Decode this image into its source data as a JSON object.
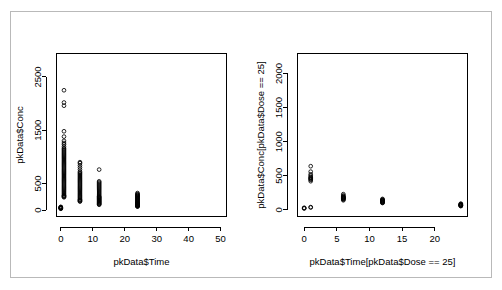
{
  "figure": {
    "background_color": "#ffffff",
    "foreground_color": "#000000",
    "frame_color": "#b9b9b9",
    "panels": 2
  },
  "chart_data": [
    {
      "type": "scatter",
      "panel": "left",
      "title": "",
      "xlabel": "pkData$Time",
      "ylabel": "pkData$Conc",
      "xlim": [
        -1.5,
        52.0
      ],
      "ylim": [
        -130,
        2950
      ],
      "xticks": [
        0,
        10,
        20,
        30,
        40,
        50
      ],
      "xtick_labels": [
        "0",
        "10",
        "20",
        "30",
        "40",
        "50"
      ],
      "yticks": [
        0,
        500,
        1500,
        2500
      ],
      "ytick_labels": [
        "0",
        "500",
        "1500",
        "2500"
      ],
      "grid": false,
      "legend": null,
      "marker": "open-circle",
      "series": [
        {
          "name": "pkData",
          "x": [
            0,
            0,
            0,
            0,
            0,
            0,
            0,
            0,
            1,
            1,
            1,
            1,
            1,
            1,
            1,
            1,
            1,
            1,
            1,
            1,
            1,
            1,
            1,
            1,
            1,
            1,
            1,
            1,
            1,
            1,
            1,
            1,
            1,
            1,
            1,
            1,
            1,
            1,
            1,
            1,
            1,
            1,
            1,
            1,
            1,
            1,
            1,
            1,
            1,
            1,
            1,
            1,
            1,
            1,
            1,
            1,
            1,
            1,
            1,
            1,
            1,
            1,
            1,
            1,
            1,
            1,
            6,
            6,
            6,
            6,
            6,
            6,
            6,
            6,
            6,
            6,
            6,
            6,
            6,
            6,
            6,
            6,
            6,
            6,
            6,
            6,
            6,
            6,
            6,
            6,
            6,
            6,
            6,
            6,
            6,
            6,
            6,
            6,
            6,
            6,
            6,
            6,
            12,
            12,
            12,
            12,
            12,
            12,
            12,
            12,
            12,
            12,
            12,
            12,
            12,
            12,
            12,
            12,
            12,
            12,
            12,
            12,
            12,
            12,
            12,
            12,
            12,
            12,
            12,
            12,
            12,
            12,
            12,
            12,
            24,
            24,
            24,
            24,
            24,
            24,
            24,
            24,
            24,
            24,
            24,
            24,
            24,
            24,
            24,
            24,
            24,
            24,
            24,
            24,
            24,
            24,
            24,
            24,
            24,
            24,
            24,
            24,
            24,
            24,
            24,
            24
          ],
          "y": [
            30,
            40,
            45,
            55,
            60,
            35,
            50,
            25,
            2250,
            2020,
            1960,
            1480,
            1380,
            1300,
            1260,
            1230,
            1190,
            1160,
            1140,
            1120,
            1100,
            1080,
            1060,
            1040,
            1020,
            1000,
            980,
            960,
            940,
            920,
            900,
            880,
            860,
            840,
            820,
            800,
            780,
            760,
            740,
            720,
            700,
            680,
            660,
            640,
            620,
            600,
            580,
            560,
            540,
            520,
            500,
            480,
            460,
            440,
            420,
            400,
            380,
            360,
            340,
            320,
            300,
            280,
            270,
            260,
            250,
            240,
            900,
            880,
            840,
            800,
            760,
            720,
            700,
            680,
            660,
            640,
            620,
            600,
            580,
            560,
            540,
            520,
            500,
            480,
            460,
            440,
            420,
            400,
            380,
            360,
            340,
            320,
            300,
            280,
            260,
            240,
            220,
            200,
            190,
            180,
            170,
            160,
            760,
            540,
            520,
            500,
            480,
            460,
            440,
            420,
            400,
            380,
            360,
            340,
            320,
            300,
            280,
            260,
            250,
            240,
            230,
            220,
            210,
            200,
            190,
            180,
            170,
            160,
            150,
            140,
            130,
            120,
            110,
            100,
            320,
            300,
            290,
            280,
            270,
            260,
            250,
            240,
            230,
            220,
            210,
            200,
            190,
            180,
            170,
            160,
            150,
            140,
            130,
            125,
            120,
            115,
            110,
            105,
            100,
            95,
            90,
            85,
            80,
            75,
            70,
            65
          ]
        }
      ]
    },
    {
      "type": "scatter",
      "panel": "right",
      "title": "",
      "xlabel": "pkData$Time[pkData$Dose == 25]",
      "ylabel": "pkData$Conc[pkData$Dose == 25]",
      "xlim": [
        -1.1,
        25.1
      ],
      "ylim": [
        -105,
        2300
      ],
      "xticks": [
        0,
        5,
        10,
        15,
        20
      ],
      "xtick_labels": [
        "0",
        "5",
        "10",
        "15",
        "20"
      ],
      "yticks": [
        0,
        500,
        1000,
        1500,
        2000
      ],
      "ytick_labels": [
        "0",
        "500",
        "1000",
        "1500",
        "2000"
      ],
      "grid": false,
      "legend": null,
      "marker": "open-circle",
      "series": [
        {
          "name": "pkData[Dose == 25]",
          "x": [
            0,
            0,
            0,
            1,
            1,
            1,
            1,
            1,
            1,
            1,
            1,
            1,
            1,
            1,
            1,
            6,
            6,
            6,
            6,
            6,
            6,
            6,
            6,
            6,
            6,
            6,
            6,
            12,
            12,
            12,
            12,
            12,
            12,
            12,
            12,
            12,
            12,
            12,
            12,
            24,
            24,
            24,
            24,
            24,
            24,
            24,
            24,
            24,
            24
          ],
          "y": [
            20,
            30,
            25,
            40,
            35,
            640,
            560,
            520,
            500,
            480,
            470,
            460,
            450,
            440,
            420,
            230,
            210,
            200,
            190,
            185,
            180,
            175,
            170,
            165,
            160,
            150,
            140,
            160,
            150,
            145,
            140,
            135,
            130,
            125,
            120,
            115,
            110,
            105,
            100,
            90,
            85,
            80,
            75,
            70,
            68,
            65,
            62,
            58,
            55
          ]
        }
      ]
    }
  ]
}
